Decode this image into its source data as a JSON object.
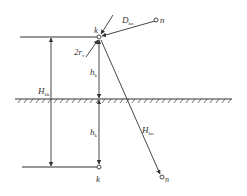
{
  "diagram": {
    "type": "geometry-schematic",
    "labels": {
      "node_top": "k",
      "node_bottom": "k",
      "node_n_top": "n",
      "node_n_bottom": "n",
      "D_main": "D",
      "D_sub": "kn",
      "r_prefix": "2r",
      "r_sub": "v",
      "H_left_main": "H",
      "H_left_sub": "kk",
      "h_upper_main": "h",
      "h_upper_sub": "k",
      "h_lower_main": "h",
      "h_lower_sub": "k",
      "H_right_main": "H",
      "H_right_sub": "kn"
    },
    "elements": [
      "top horizontal line ending at node k",
      "ground surface with hatching",
      "bottom horizontal line ending at mirror node k",
      "vertical dimension H_kk between top and bottom lines",
      "vertical dimensions h_k above and below ground",
      "distance D_kn from node n to node k",
      "distance H_kn from node k to mirror node n",
      "radius indicator 2r_v at node k"
    ],
    "colors": {
      "line": "#333333",
      "background": "#ffffff"
    }
  }
}
